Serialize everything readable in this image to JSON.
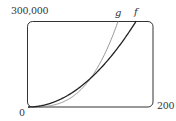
{
  "chart_data": {
    "type": "line",
    "title": "",
    "xlabel": "",
    "ylabel": "",
    "xlim": [
      0,
      200
    ],
    "ylim": [
      0,
      300000
    ],
    "x_tick_labels": [
      "0",
      "200"
    ],
    "y_tick_labels": [
      "300,000"
    ],
    "grid": false,
    "legend": "curve labels at top end of each curve",
    "series": [
      {
        "name": "f",
        "color": "#222222",
        "formula_estimate": "f(x) = 10x^2",
        "x": [
          0,
          25,
          50,
          75,
          100,
          125,
          150,
          173
        ],
        "y": [
          0,
          6250,
          25000,
          56250,
          100000,
          156250,
          225000,
          300000
        ]
      },
      {
        "name": "g",
        "color": "#8a8a8a",
        "formula_estimate": "g(x) = x^3/10",
        "x": [
          0,
          25,
          50,
          75,
          100,
          125,
          144
        ],
        "y": [
          0,
          1563,
          12500,
          42188,
          100000,
          195313,
          298598
        ]
      }
    ],
    "annotations": [
      "curves intersect near (100, 100000)"
    ]
  },
  "labels": {
    "y_max": "300,000",
    "x_max": "200",
    "origin": "0",
    "curve_f": "f",
    "curve_g": "g"
  }
}
